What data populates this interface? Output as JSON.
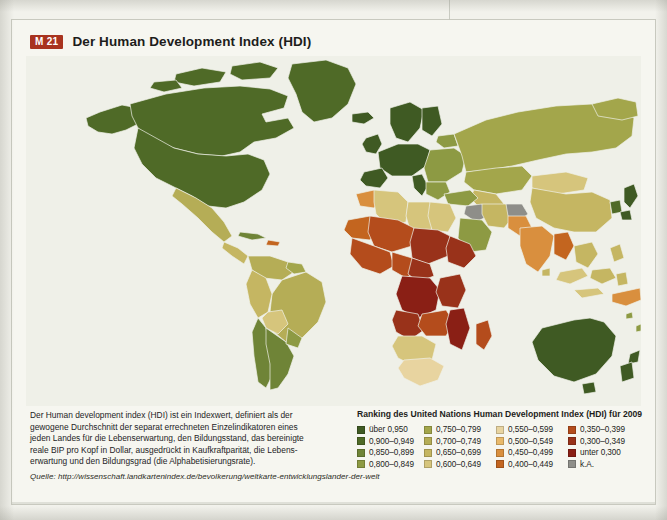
{
  "header": {
    "badge": "M 21",
    "title": "Der Human Development Index (HDI)"
  },
  "description": {
    "line1": "Der Human development index (HDI) ist ein Indexwert, definiert als der",
    "line2": "gewogene Durchschnitt der separat errechneten Einzelindikatoren eines",
    "line3": "jeden Landes für die Lebenserwartung, den Bildungsstand, das bereinigte",
    "line4": "reale BIP pro Kopf in Dollar, ausgedrückt in Kaufkraftparität, die Lebens-",
    "line5": "erwartung und den Bildungsgrad (die Alphabetisierungsrate)."
  },
  "source": {
    "label": "Quelle:",
    "url": "http://wissenschaft.landkartenindex.de/bevolkerung/weltkarte-entwicklungslander-der-welt"
  },
  "legend": {
    "title": "Ranking des United Nations Human Development Index (HDI) für 2009",
    "columns": [
      {
        "items": [
          {
            "label": "über 0,950",
            "color": "#3f5a23"
          },
          {
            "label": "0,900–0,949",
            "color": "#4f6a27"
          },
          {
            "label": "0,850–0,899",
            "color": "#6f8437"
          },
          {
            "label": "0,800–0,849",
            "color": "#8d9a43"
          }
        ]
      },
      {
        "items": [
          {
            "label": "0,750–0,799",
            "color": "#a3a64b"
          },
          {
            "label": "0,700–0,749",
            "color": "#b5ad56"
          },
          {
            "label": "0,650–0,699",
            "color": "#c5b662"
          },
          {
            "label": "0,600–0,649",
            "color": "#d6c57c"
          }
        ]
      },
      {
        "items": [
          {
            "label": "0,550–0,599",
            "color": "#e8d4a0"
          },
          {
            "label": "0,500–0,549",
            "color": "#e9b96a"
          },
          {
            "label": "0,450–0,499",
            "color": "#d98f3e"
          },
          {
            "label": "0,400–0,449",
            "color": "#c3651f"
          }
        ]
      },
      {
        "items": [
          {
            "label": "0,350–0,399",
            "color": "#b44c1c"
          },
          {
            "label": "0,300–0,349",
            "color": "#99321a"
          },
          {
            "label": "unter  0,300",
            "color": "#8a1f15"
          },
          {
            "label": "k.A.",
            "color": "#8e8e89"
          }
        ]
      }
    ]
  },
  "map": {
    "ocean_color": "#eff0e8",
    "regions": [
      {
        "name": "canada",
        "hdi_class": "über 0,950",
        "color": "#4f6a27"
      },
      {
        "name": "united-states",
        "hdi_class": "0,900–0,949",
        "color": "#4f6a27"
      },
      {
        "name": "greenland",
        "hdi_class": "0,900–0,949",
        "color": "#4f6a27"
      },
      {
        "name": "mexico",
        "hdi_class": "0,750–0,799",
        "color": "#b5ad56"
      },
      {
        "name": "central-america",
        "hdi_class": "0,700–0,749",
        "color": "#c5b662"
      },
      {
        "name": "brazil",
        "hdi_class": "0,700–0,749",
        "color": "#b5ad56"
      },
      {
        "name": "argentina",
        "hdi_class": "0,850–0,899",
        "color": "#6f8437"
      },
      {
        "name": "chile",
        "hdi_class": "0,850–0,899",
        "color": "#6f8437"
      },
      {
        "name": "bolivia",
        "hdi_class": "0,650–0,699",
        "color": "#d6c57c"
      },
      {
        "name": "western-europe",
        "hdi_class": "über 0,950",
        "color": "#3f5a23"
      },
      {
        "name": "eastern-europe",
        "hdi_class": "0,800–0,849",
        "color": "#8d9a43"
      },
      {
        "name": "russia",
        "hdi_class": "0,800–0,849",
        "color": "#a3a64b"
      },
      {
        "name": "north-africa",
        "hdi_class": "0,650–0,699",
        "color": "#d6c57c"
      },
      {
        "name": "west-africa",
        "hdi_class": "0,350–0,399",
        "color": "#b44c1c"
      },
      {
        "name": "central-africa",
        "hdi_class": "unter 0,300",
        "color": "#8a1f15"
      },
      {
        "name": "southern-africa",
        "hdi_class": "0,400–0,449",
        "color": "#d6c57c"
      },
      {
        "name": "south-africa",
        "hdi_class": "0,600–0,649",
        "color": "#e8d4a0"
      },
      {
        "name": "india",
        "hdi_class": "0,600–0,649",
        "color": "#d98f3e"
      },
      {
        "name": "china",
        "hdi_class": "0,750–0,799",
        "color": "#c5b662"
      },
      {
        "name": "mongolia",
        "hdi_class": "0,700–0,749",
        "color": "#d6c57c"
      },
      {
        "name": "japan",
        "hdi_class": "über 0,950",
        "color": "#3f5a23"
      },
      {
        "name": "southeast-asia",
        "hdi_class": "0,700–0,749",
        "color": "#c5b662"
      },
      {
        "name": "australia",
        "hdi_class": "über 0,950",
        "color": "#3f5a23"
      },
      {
        "name": "new-zealand",
        "hdi_class": "über 0,950",
        "color": "#3f5a23"
      },
      {
        "name": "saudi-arabia",
        "hdi_class": "0,800–0,849",
        "color": "#8d9a43"
      },
      {
        "name": "iraq",
        "hdi_class": "k.A.",
        "color": "#8e8e89"
      },
      {
        "name": "afghanistan",
        "hdi_class": "k.A.",
        "color": "#8e8e89"
      },
      {
        "name": "papua-new-guinea",
        "hdi_class": "0,450–0,499",
        "color": "#d98f3e"
      }
    ]
  }
}
